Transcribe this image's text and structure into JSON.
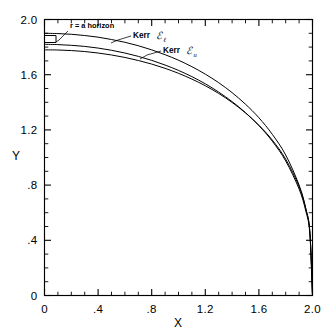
{
  "figure": {
    "background_color": "#ffffff",
    "line_color": "#000000"
  },
  "chart_data": {
    "type": "line",
    "title": "",
    "xlabel": "X",
    "ylabel": "Y",
    "xlim": [
      0,
      2.0
    ],
    "ylim": [
      0,
      2.0
    ],
    "grid": false,
    "legend_position": "inline-annotations",
    "x_ticks": [
      "0",
      ".4",
      ".8",
      "1.2",
      "1.6",
      "2.0"
    ],
    "x_tick_values": [
      0,
      0.4,
      0.8,
      1.2,
      1.6,
      2.0
    ],
    "y_ticks": [
      "0",
      ".4",
      ".8",
      "1.2",
      "1.6",
      "2.0"
    ],
    "y_tick_values": [
      0,
      0.4,
      0.8,
      1.2,
      1.6,
      2.0
    ],
    "minor_tick_step": 0.1,
    "series": [
      {
        "name": "Kerr E_l",
        "label": "Kerr",
        "symbol": "ℰ",
        "subscript": "ℓ",
        "points": [
          [
            0.0,
            1.9
          ],
          [
            0.1,
            1.898
          ],
          [
            0.2,
            1.893
          ],
          [
            0.3,
            1.884
          ],
          [
            0.4,
            1.872
          ],
          [
            0.5,
            1.855
          ],
          [
            0.6,
            1.835
          ],
          [
            0.7,
            1.81
          ],
          [
            0.8,
            1.78
          ],
          [
            0.9,
            1.745
          ],
          [
            1.0,
            1.705
          ],
          [
            1.1,
            1.658
          ],
          [
            1.2,
            1.604
          ],
          [
            1.3,
            1.542
          ],
          [
            1.4,
            1.47
          ],
          [
            1.5,
            1.386
          ],
          [
            1.6,
            1.288
          ],
          [
            1.7,
            1.168
          ],
          [
            1.8,
            1.018
          ],
          [
            1.9,
            0.8
          ],
          [
            1.95,
            0.63
          ],
          [
            1.98,
            0.46
          ],
          [
            2.0,
            0.0
          ]
        ]
      },
      {
        "name": "Kerr E_u",
        "label": "Kerr",
        "symbol": "ℰ",
        "subscript": "u",
        "points": [
          [
            0.0,
            1.82
          ],
          [
            0.1,
            1.818
          ],
          [
            0.2,
            1.813
          ],
          [
            0.3,
            1.805
          ],
          [
            0.4,
            1.793
          ],
          [
            0.5,
            1.777
          ],
          [
            0.6,
            1.757
          ],
          [
            0.7,
            1.733
          ],
          [
            0.8,
            1.704
          ],
          [
            0.9,
            1.67
          ],
          [
            1.0,
            1.631
          ],
          [
            1.1,
            1.586
          ],
          [
            1.2,
            1.534
          ],
          [
            1.3,
            1.474
          ],
          [
            1.4,
            1.405
          ],
          [
            1.5,
            1.325
          ],
          [
            1.6,
            1.231
          ],
          [
            1.7,
            1.118
          ],
          [
            1.8,
            0.975
          ],
          [
            1.9,
            0.772
          ],
          [
            1.95,
            0.612
          ],
          [
            1.98,
            0.45
          ],
          [
            2.0,
            0.0
          ]
        ]
      },
      {
        "name": "r = a horizon",
        "label": "r = a horizon",
        "points": [
          [
            0.0,
            1.78
          ],
          [
            0.1,
            1.779
          ],
          [
            0.2,
            1.775
          ],
          [
            0.3,
            1.768
          ],
          [
            0.4,
            1.757
          ],
          [
            0.5,
            1.743
          ],
          [
            0.6,
            1.725
          ],
          [
            0.7,
            1.703
          ],
          [
            0.8,
            1.677
          ],
          [
            0.9,
            1.646
          ],
          [
            1.0,
            1.61
          ],
          [
            1.1,
            1.568
          ],
          [
            1.2,
            1.52
          ],
          [
            1.3,
            1.464
          ],
          [
            1.4,
            1.399
          ],
          [
            1.5,
            1.323
          ],
          [
            1.6,
            1.234
          ],
          [
            1.7,
            1.126
          ],
          [
            1.8,
            0.988
          ],
          [
            1.9,
            0.79
          ],
          [
            1.95,
            0.628
          ],
          [
            1.98,
            0.465
          ],
          [
            2.0,
            0.0
          ]
        ]
      }
    ],
    "annotations": [
      {
        "name": "r-a-horizon",
        "text": "r = a horizon",
        "symbol": "",
        "subscript": "",
        "text_x": 70,
        "text_y": 28,
        "leader": "M 68 31 L 59 40 L 56 42"
      },
      {
        "name": "kerr-e-lower",
        "text": "Kerr",
        "symbol": "ℰ",
        "subscript": "ℓ",
        "text_x": 133,
        "text_y": 38,
        "leader": "M 131 36 L 118 40 L 111 43"
      },
      {
        "name": "kerr-e-upper",
        "text": "Kerr",
        "symbol": "ℰ",
        "subscript": "u",
        "text_x": 163,
        "text_y": 53,
        "leader": "M 161 51 L 147 55 L 140 59"
      }
    ]
  },
  "axis": {
    "x_title": "X",
    "y_title": "Y"
  }
}
